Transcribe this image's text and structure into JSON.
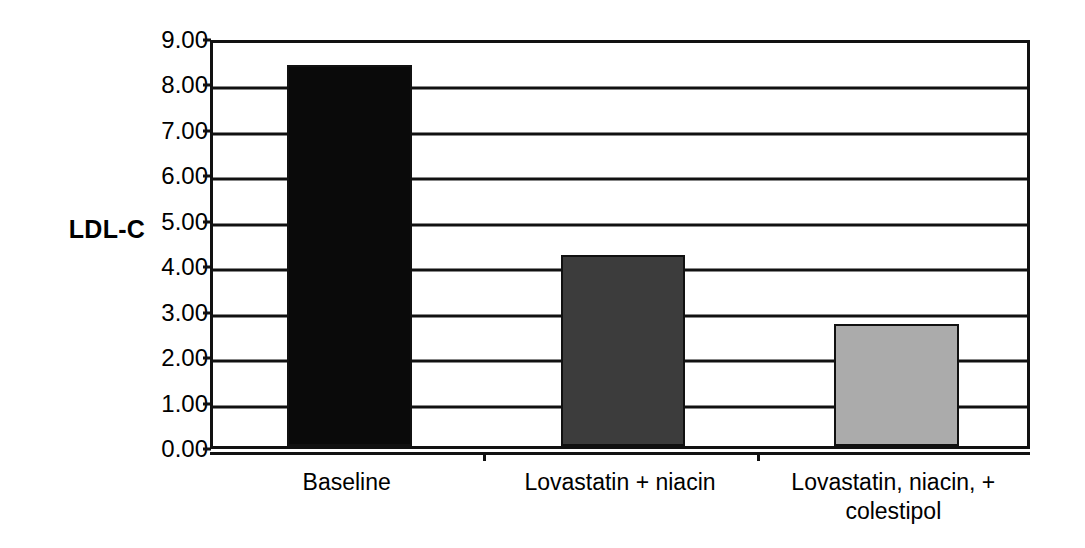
{
  "chart_data": {
    "type": "bar",
    "title": "",
    "subtitle": "",
    "xlabel": "",
    "ylabel": "LDL-C",
    "categories": [
      "Baseline",
      "Lovastatin + niacin",
      "Lovastatin, niacin, +\ncolestipol"
    ],
    "values": [
      8.38,
      4.2,
      2.68
    ],
    "series": [
      {
        "name": "LDL-C",
        "values": [
          8.38,
          4.2,
          2.68
        ]
      }
    ],
    "ylim": [
      0.0,
      9.0
    ],
    "ytick_labels": [
      "9.00",
      "8.00",
      "7.00",
      "6.00",
      "5.00",
      "4.00",
      "3.00",
      "2.00",
      "1.00",
      "0.00"
    ],
    "ytick_values": [
      9,
      8,
      7,
      6,
      5,
      4,
      3,
      2,
      1,
      0
    ],
    "ytick_step": 1.0,
    "grid": true,
    "grid_axis": "y",
    "legend": false,
    "legend_position": "none",
    "bar_colors": [
      "#0a0a0a",
      "#3c3c3c",
      "#ababab"
    ],
    "bar_edge_color": "#111111",
    "axis_color": "#111111",
    "background_color": "#ffffff",
    "annotations": []
  }
}
